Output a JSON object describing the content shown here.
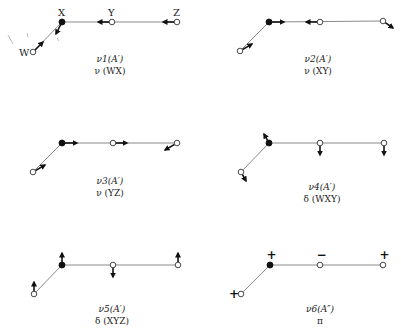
{
  "figure": {
    "atom_labels": {
      "W": "W",
      "X": "X",
      "Y": "Y",
      "Z": "Z"
    },
    "colors": {
      "bond": "#8a8a8a",
      "atom_stroke": "#333333",
      "central_atom": "#111111",
      "arrow": "#111111",
      "text": "#222222"
    },
    "modes": [
      {
        "id": "nu1",
        "symbol": "ν1(A′)",
        "description": "ν (WX)",
        "atoms": {
          "W": [
            33,
            52
          ],
          "X": [
            62,
            22
          ],
          "Y": [
            112,
            22
          ],
          "Z": [
            177,
            22
          ]
        },
        "displacements": {
          "W": [
            10,
            -10
          ],
          "X": [
            -6,
            12
          ],
          "Y": [
            -14,
            0
          ],
          "Z": [
            -14,
            0
          ]
        },
        "label_pos": [
          110,
          62
        ]
      },
      {
        "id": "nu2",
        "symbol": "ν2(A′)",
        "description": "ν (XY)",
        "atoms": {
          "W": [
            240,
            51
          ],
          "X": [
            269,
            22
          ],
          "Y": [
            320,
            22
          ],
          "Z": [
            383,
            21
          ]
        },
        "displacements": {
          "W": [
            12,
            -7
          ],
          "X": [
            15,
            0
          ],
          "Y": [
            -14,
            0
          ],
          "Z": [
            10,
            7
          ]
        },
        "label_pos": [
          318,
          62
        ]
      },
      {
        "id": "nu3",
        "symbol": "ν3(A′)",
        "description": "ν (YZ)",
        "atoms": {
          "W": [
            33,
            172
          ],
          "X": [
            62,
            143
          ],
          "Y": [
            113,
            143
          ],
          "Z": [
            177,
            143
          ]
        },
        "displacements": {
          "W": [
            12,
            -7
          ],
          "X": [
            15,
            0
          ],
          "Y": [
            14,
            0
          ],
          "Z": [
            -12,
            7
          ]
        },
        "label_pos": [
          110,
          184
        ]
      },
      {
        "id": "nu4",
        "symbol": "ν4(A′)",
        "description": "δ (WXY)",
        "atoms": {
          "W": [
            241,
            172
          ],
          "X": [
            269,
            143
          ],
          "Y": [
            320,
            143
          ],
          "Z": [
            384,
            143
          ]
        },
        "displacements": {
          "W": [
            5,
            9
          ],
          "X": [
            -5,
            -9
          ],
          "Y": [
            0,
            12
          ],
          "Z": [
            0,
            12
          ]
        },
        "label_pos": [
          322,
          190
        ]
      },
      {
        "id": "nu5",
        "symbol": "ν5(A′)",
        "description": "δ (XYZ)",
        "atoms": {
          "W": [
            34,
            294
          ],
          "X": [
            62,
            265
          ],
          "Y": [
            113,
            265
          ],
          "Z": [
            178,
            265
          ]
        },
        "displacements": {
          "W": [
            0,
            -12
          ],
          "X": [
            0,
            -12
          ],
          "Y": [
            0,
            12
          ],
          "Z": [
            0,
            -12
          ]
        },
        "label_pos": [
          112,
          312
        ]
      },
      {
        "id": "nu6",
        "symbol": "ν6(A″)",
        "description": "π",
        "atoms": {
          "W": [
            241,
            294
          ],
          "X": [
            270,
            265
          ],
          "Y": [
            320,
            265
          ],
          "Z": [
            383,
            265
          ]
        },
        "signs": {
          "W": "+",
          "X": "+",
          "Y": "−",
          "Z": "+"
        },
        "label_pos": [
          320,
          312
        ]
      }
    ]
  }
}
